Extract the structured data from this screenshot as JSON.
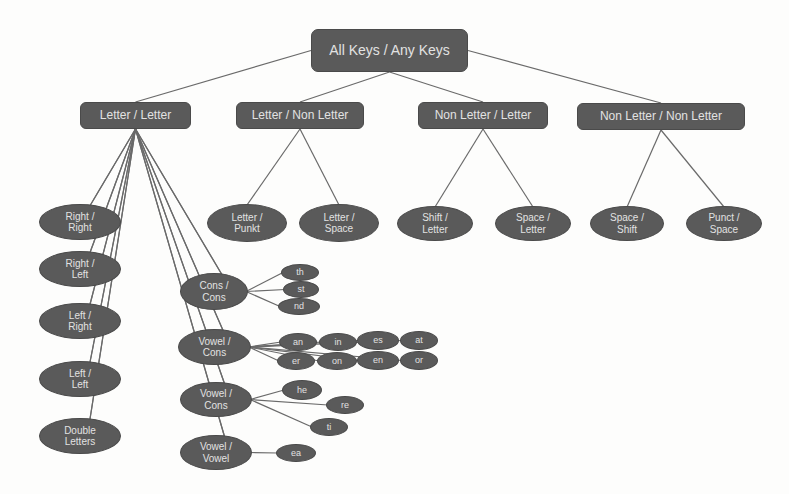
{
  "diagram": {
    "root": {
      "id": "root",
      "label": "All Keys / Any Keys",
      "x": 311,
      "y": 29,
      "w": 157,
      "h": 43
    },
    "level1": [
      {
        "id": "ll",
        "label": "Letter / Letter",
        "x": 80,
        "y": 102,
        "w": 111,
        "h": 27
      },
      {
        "id": "lnl",
        "label": "Letter / Non Letter",
        "x": 236,
        "y": 102,
        "w": 128,
        "h": 27
      },
      {
        "id": "nll",
        "label": "Non Letter / Letter",
        "x": 418,
        "y": 102,
        "w": 130,
        "h": 27
      },
      {
        "id": "nlnl",
        "label": "Non Letter / Non Letter",
        "x": 577,
        "y": 103,
        "w": 168,
        "h": 27
      }
    ],
    "level2": [
      {
        "id": "rr",
        "label": "Right /\nRight",
        "parent": "ll",
        "x": 39,
        "y": 204,
        "w": 82,
        "h": 36
      },
      {
        "id": "rl",
        "label": "Right /\nLeft",
        "parent": "ll",
        "x": 39,
        "y": 251,
        "w": 82,
        "h": 36
      },
      {
        "id": "lr",
        "label": "Left /\nRight",
        "parent": "ll",
        "x": 39,
        "y": 303,
        "w": 82,
        "h": 36
      },
      {
        "id": "lf",
        "label": "Left /\nLeft",
        "parent": "ll",
        "x": 39,
        "y": 361,
        "w": 82,
        "h": 36
      },
      {
        "id": "dl",
        "label": "Double\nLetters",
        "parent": "ll",
        "x": 39,
        "y": 418,
        "w": 82,
        "h": 36
      },
      {
        "id": "cc",
        "label": "Cons /\nCons",
        "parent": "ll",
        "x": 180,
        "y": 273,
        "w": 68,
        "h": 37
      },
      {
        "id": "vc1",
        "label": "Vowel /\nCons",
        "parent": "ll",
        "x": 178,
        "y": 329,
        "w": 73,
        "h": 36
      },
      {
        "id": "vc2",
        "label": "Vowel /\nCons",
        "parent": "ll",
        "x": 180,
        "y": 382,
        "w": 72,
        "h": 35
      },
      {
        "id": "vv",
        "label": "Vowel /\nVowel",
        "parent": "ll",
        "x": 180,
        "y": 435,
        "w": 72,
        "h": 35
      },
      {
        "id": "lp",
        "label": "Letter /\nPunkt",
        "parent": "lnl",
        "x": 207,
        "y": 204,
        "w": 80,
        "h": 38
      },
      {
        "id": "ls",
        "label": "Letter /\nSpace",
        "parent": "lnl",
        "x": 299,
        "y": 204,
        "w": 80,
        "h": 38
      },
      {
        "id": "sl",
        "label": "Shift /\nLetter",
        "parent": "nll",
        "x": 397,
        "y": 206,
        "w": 76,
        "h": 35
      },
      {
        "id": "spl",
        "label": "Space /\nLetter",
        "parent": "nll",
        "x": 495,
        "y": 206,
        "w": 76,
        "h": 35
      },
      {
        "id": "sps",
        "label": "Space /\nShift",
        "parent": "nlnl",
        "x": 590,
        "y": 206,
        "w": 74,
        "h": 35
      },
      {
        "id": "ps",
        "label": "Punct /\nSpace",
        "parent": "nlnl",
        "x": 686,
        "y": 206,
        "w": 76,
        "h": 35
      }
    ],
    "level3": [
      {
        "id": "th",
        "label": "th",
        "parent": "cc",
        "x": 281,
        "y": 264,
        "w": 38,
        "h": 17
      },
      {
        "id": "st",
        "label": "st",
        "parent": "cc",
        "x": 283,
        "y": 281,
        "w": 36,
        "h": 17
      },
      {
        "id": "nd",
        "label": "nd",
        "parent": "cc",
        "x": 278,
        "y": 298,
        "w": 42,
        "h": 17
      },
      {
        "id": "an",
        "label": "an",
        "parent": "vc1",
        "x": 279,
        "y": 333,
        "w": 38,
        "h": 18
      },
      {
        "id": "er",
        "label": "er",
        "parent": "vc1",
        "x": 277,
        "y": 352,
        "w": 38,
        "h": 18
      },
      {
        "id": "in",
        "label": "in",
        "parent": "vc1",
        "x": 319,
        "y": 333,
        "w": 38,
        "h": 18
      },
      {
        "id": "on",
        "label": "on",
        "parent": "vc1",
        "x": 317,
        "y": 352,
        "w": 40,
        "h": 18
      },
      {
        "id": "es",
        "label": "es",
        "parent": "vc1",
        "x": 357,
        "y": 331,
        "w": 42,
        "h": 19
      },
      {
        "id": "en",
        "label": "en",
        "parent": "vc1",
        "x": 357,
        "y": 351,
        "w": 42,
        "h": 19
      },
      {
        "id": "at",
        "label": "at",
        "parent": "vc1",
        "x": 400,
        "y": 331,
        "w": 38,
        "h": 19
      },
      {
        "id": "or",
        "label": "or",
        "parent": "vc1",
        "x": 400,
        "y": 351,
        "w": 38,
        "h": 19
      },
      {
        "id": "he",
        "label": "he",
        "parent": "vc2",
        "x": 282,
        "y": 380,
        "w": 40,
        "h": 20
      },
      {
        "id": "re",
        "label": "re",
        "parent": "vc2",
        "x": 326,
        "y": 396,
        "w": 38,
        "h": 18
      },
      {
        "id": "ti",
        "label": "ti",
        "parent": "vc2",
        "x": 310,
        "y": 418,
        "w": 38,
        "h": 18
      },
      {
        "id": "ea",
        "label": "ea",
        "parent": "vv",
        "x": 276,
        "y": 444,
        "w": 40,
        "h": 18
      }
    ],
    "colors": {
      "node_fill": "#5a5a5a",
      "node_text": "#e2e2e2",
      "edge": "#6a6a6a",
      "background": "#fdfdfc"
    }
  }
}
